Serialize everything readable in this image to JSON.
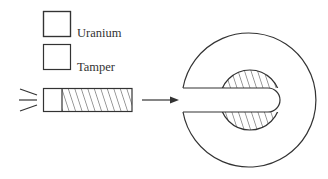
{
  "diagram": {
    "legend": [
      {
        "label": "Uranium",
        "pattern": "hatched"
      },
      {
        "label": "Tamper",
        "pattern": "empty"
      }
    ],
    "components": {
      "projectile": {
        "description": "Bullet: tamper plug followed by hatched uranium cylinder",
        "motion_lines": 3
      },
      "arrow": {
        "direction": "right"
      },
      "target": {
        "description": "Tamper sphere with slot and hatched uranium core ring"
      }
    },
    "colors": {
      "stroke": "#333333",
      "background": "#ffffff"
    }
  }
}
